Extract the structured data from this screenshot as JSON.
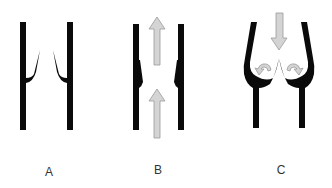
{
  "colors": {
    "wall": "#0a0a0a",
    "arrow_fill": "#d4d4d4",
    "arrow_stroke": "#9a9a9a",
    "label": "#333333",
    "background": "#ffffff"
  },
  "panels": [
    {
      "id": "A",
      "label": "A",
      "description": "vessel with closed valve leaflets, no flow"
    },
    {
      "id": "B",
      "label": "B",
      "description": "valve open with forward upward flow arrows"
    },
    {
      "id": "C",
      "label": "C",
      "description": "valve closed with backward downward flow filling sinuses, curved eddy arrows"
    }
  ]
}
